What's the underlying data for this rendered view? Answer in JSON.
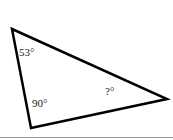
{
  "diagram": {
    "type": "triangle",
    "stroke_color": "#000000",
    "angles": [
      {
        "vertex": "top-left",
        "label": "53°"
      },
      {
        "vertex": "bottom-left",
        "label": "90°"
      },
      {
        "vertex": "right",
        "label": "?°"
      }
    ]
  }
}
